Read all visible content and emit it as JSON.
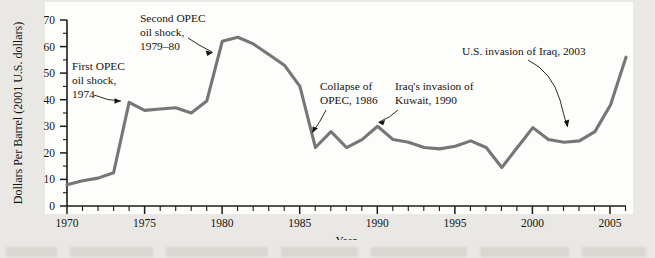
{
  "chart_data": {
    "type": "line",
    "title": "",
    "xlabel": "Year",
    "ylabel": "Dollars Per Barrel (2001 U.S. dollars)",
    "xlim": [
      1970,
      2006
    ],
    "ylim": [
      0,
      70
    ],
    "grid": false,
    "legend": "none",
    "series_name": "Crude oil price (2001 U.S. dollars per barrel)",
    "line_color": "#767676",
    "axis_color": "#1b1b1b",
    "x_tick_labels": [
      "1970",
      "1975",
      "1980",
      "1985",
      "1990",
      "1995",
      "2000",
      "2005"
    ],
    "x_ticks": [
      1970,
      1975,
      1980,
      1985,
      1990,
      1995,
      2000,
      2005
    ],
    "x_minor_tick_interval": 1,
    "y_tick_labels": [
      "0",
      "10",
      "20",
      "30",
      "40",
      "50",
      "60",
      "70"
    ],
    "y_ticks": [
      0,
      10,
      20,
      30,
      40,
      50,
      60,
      70
    ],
    "y_minor_tick_interval": 5,
    "x": [
      1970,
      1971,
      1972,
      1973,
      1974,
      1975,
      1976,
      1977,
      1978,
      1979,
      1980,
      1981,
      1982,
      1983,
      1984,
      1985,
      1986,
      1987,
      1988,
      1989,
      1990,
      1991,
      1992,
      1993,
      1994,
      1995,
      1996,
      1997,
      1998,
      1999,
      2000,
      2001,
      2002,
      2003,
      2004,
      2005,
      2006
    ],
    "values": [
      8.0,
      9.5,
      10.5,
      12.5,
      39.0,
      36.0,
      36.5,
      37.0,
      35.0,
      39.5,
      62.0,
      63.5,
      61.0,
      57.0,
      53.0,
      45.0,
      22.0,
      28.0,
      22.0,
      25.0,
      30.0,
      25.0,
      24.0,
      22.0,
      21.5,
      22.5,
      24.5,
      22.0,
      14.5,
      22.0,
      29.5,
      25.0,
      24.0,
      24.5,
      28.0,
      38.0,
      56.0
    ],
    "annotations": [
      {
        "id": "first-opec-oil-shock",
        "text": [
          "First OPEC",
          "oil shock,",
          "1974"
        ],
        "points_to_year": 1974,
        "points_to_value": 39.0
      },
      {
        "id": "second-opec-oil-shock",
        "text": [
          "Second OPEC",
          "oil shock,",
          "1979–80"
        ],
        "points_to_year": 1980,
        "points_to_value": 58.0
      },
      {
        "id": "collapse-of-opec",
        "text": [
          "Collapse of",
          "OPEC, 1986"
        ],
        "points_to_year": 1986,
        "points_to_value": 22.0
      },
      {
        "id": "iraq-invasion-of-kuwait",
        "text": [
          "Iraq's invasion of",
          "Kuwait, 1990"
        ],
        "points_to_year": 1990,
        "points_to_value": 30.0
      },
      {
        "id": "us-invasion-of-iraq",
        "text": [
          "U.S. invasion of Iraq, 2003"
        ],
        "points_to_year": 2003,
        "points_to_value": 26.5
      }
    ]
  },
  "axes": {
    "x_title": "Year",
    "y_title": "Dollars Per Barrel (2001 U.S. dollars)"
  },
  "annotation_text": {
    "a1l1": "First OPEC",
    "a1l2": "oil shock,",
    "a1l3": "1974",
    "a2l1": "Second OPEC",
    "a2l2": "oil shock,",
    "a2l3": "1979–80",
    "a3l1": "Collapse of",
    "a3l2": "OPEC, 1986",
    "a4l1": "Iraq's invasion of",
    "a4l2": "Kuwait, 1990",
    "a5l1": "U.S. invasion of Iraq, 2003"
  },
  "ticks": {
    "y": {
      "t0": "0",
      "t10": "10",
      "t20": "20",
      "t30": "30",
      "t40": "40",
      "t50": "50",
      "t60": "60",
      "t70": "70"
    },
    "x": {
      "x1970": "1970",
      "x1975": "1975",
      "x1980": "1980",
      "x1985": "1985",
      "x1990": "1990",
      "x1995": "1995",
      "x2000": "2000",
      "x2005": "2005"
    }
  },
  "colors": {
    "line": "#767676",
    "axis": "#1b1b1b",
    "plot_background": "#fdfdfb",
    "page_background": "#e9e8e4"
  }
}
